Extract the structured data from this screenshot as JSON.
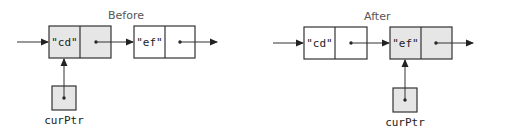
{
  "colors": {
    "stroke": "#333333",
    "highlight_fill": "#e6e6e6",
    "plain_fill": "#ffffff",
    "text": "#222222",
    "title_text": "#555555"
  },
  "panels": [
    {
      "title": "Before",
      "nodes": [
        {
          "value": "\"cd\"",
          "highlighted": true
        },
        {
          "value": "\"ef\"",
          "highlighted": false
        }
      ],
      "pointer_label": "curPtr",
      "pointer_target_index": 0
    },
    {
      "title": "After",
      "nodes": [
        {
          "value": "\"cd\"",
          "highlighted": false
        },
        {
          "value": "\"ef\"",
          "highlighted": true
        }
      ],
      "pointer_label": "curPtr",
      "pointer_target_index": 1
    }
  ]
}
